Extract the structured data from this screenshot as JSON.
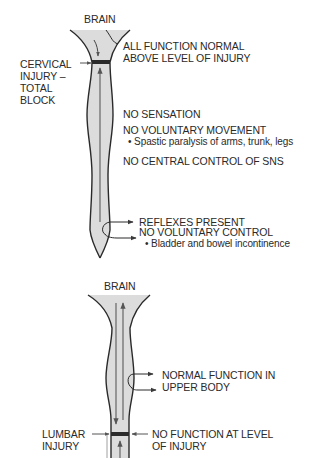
{
  "colors": {
    "cord_fill": "#dcdcdc",
    "outline": "#2a2a2a",
    "tract": "#6e6e6e",
    "injury_block": "#2b2b2b",
    "text": "#2a2a2a",
    "background": "#ffffff"
  },
  "panel_top": {
    "title": "Cervical injury – total block",
    "brain_label": "BRAIN",
    "injury_label": [
      "CERVICAL",
      "INJURY –",
      "TOTAL",
      "BLOCK"
    ],
    "above_label": [
      "ALL FUNCTION NORMAL",
      "ABOVE LEVEL OF INJURY"
    ],
    "effects": {
      "sensation": "NO SENSATION",
      "movement": "NO VOLUNTARY MOVEMENT",
      "movement_detail": "Spastic paralysis of arms, trunk, legs",
      "sns": "NO CENTRAL CONTROL OF SNS"
    },
    "reflex": {
      "line1": "REFLEXES PRESENT",
      "line2": "NO VOLUNTARY CONTROL",
      "detail": "Bladder and bowel incontinence"
    }
  },
  "panel_bottom": {
    "title": "Lumbar injury",
    "brain_label": "BRAIN",
    "upper_label": [
      "NORMAL FUNCTION IN",
      "UPPER BODY"
    ],
    "injury_label": [
      "LUMBAR",
      "INJURY"
    ],
    "level_label": [
      "NO FUNCTION AT LEVEL",
      "OF INJURY"
    ]
  }
}
